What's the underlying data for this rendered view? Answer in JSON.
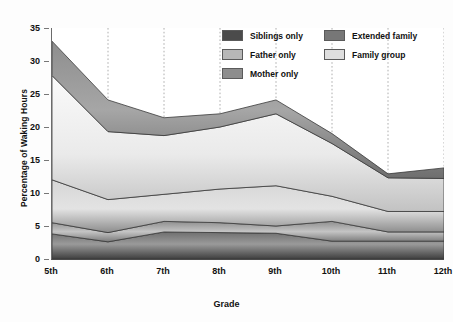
{
  "chart_data": {
    "type": "area",
    "stacked": true,
    "title": "",
    "xlabel": "Grade",
    "ylabel": "Percentage of Waking Hours",
    "categories": [
      "5th",
      "6th",
      "7th",
      "8th",
      "9th",
      "10th",
      "11th",
      "12th"
    ],
    "x_tick_labels": [
      "5th",
      "6th",
      "7th",
      "8th",
      "9th",
      "10th",
      "11th",
      "12th"
    ],
    "y_tick_labels": [
      "0",
      "5",
      "10",
      "15",
      "20",
      "25",
      "30",
      "35"
    ],
    "y_ticks": [
      0,
      5,
      10,
      15,
      20,
      25,
      30,
      35
    ],
    "ylim": [
      0,
      35
    ],
    "grid": "vertical dotted gridlines at each category",
    "legend_position": "top-right inside plot",
    "series": [
      {
        "name": "Siblings only",
        "color": "#4b4b4b",
        "values": [
          3.8,
          2.6,
          4.1,
          4.0,
          3.9,
          2.7,
          2.7,
          2.7
        ],
        "cumulative_top": [
          3.8,
          2.6,
          4.1,
          4.0,
          3.9,
          2.7,
          2.7,
          2.7
        ]
      },
      {
        "name": "Mother only",
        "color": "#8d8d8d",
        "values": [
          1.7,
          1.4,
          1.6,
          1.5,
          1.1,
          3.0,
          1.4,
          1.4
        ],
        "cumulative_top": [
          5.5,
          4.0,
          5.7,
          5.5,
          5.0,
          5.7,
          4.1,
          4.1
        ]
      },
      {
        "name": "Father only",
        "color": "#b7b7b7",
        "values": [
          6.5,
          5.0,
          4.1,
          5.1,
          6.1,
          3.8,
          3.1,
          3.1
        ],
        "cumulative_top": [
          12.0,
          9.0,
          9.8,
          10.6,
          11.1,
          9.5,
          7.2,
          7.2
        ]
      },
      {
        "name": "Family group",
        "color": "#dedede",
        "values": [
          15.8,
          10.3,
          8.9,
          9.4,
          10.9,
          8.0,
          5.1,
          5.0
        ],
        "cumulative_top": [
          27.8,
          19.3,
          18.7,
          20.0,
          22.0,
          17.5,
          12.3,
          12.2
        ]
      },
      {
        "name": "Extended family",
        "color": "#777777",
        "values": [
          5.2,
          4.8,
          2.7,
          2.0,
          2.1,
          1.5,
          0.6,
          1.6
        ],
        "cumulative_top": [
          33.0,
          24.1,
          21.4,
          22.0,
          24.1,
          19.0,
          12.9,
          13.8
        ]
      }
    ]
  },
  "legend": {
    "left_column": [
      {
        "label": "Siblings only",
        "color": "#4b4b4b"
      },
      {
        "label": "Father only",
        "color": "#b7b7b7"
      },
      {
        "label": "Mother only",
        "color": "#8d8d8d"
      }
    ],
    "right_column": [
      {
        "label": "Extended family",
        "color": "#777777"
      },
      {
        "label": "Family group",
        "color": "#dedede"
      }
    ]
  },
  "axes": {
    "x_title": "Grade",
    "y_title": "Percentage of Waking Hours"
  }
}
